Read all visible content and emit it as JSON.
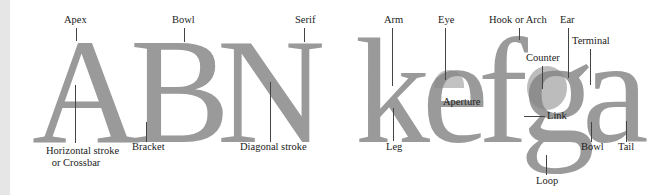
{
  "diagram": {
    "glyph_color": "#9a9a9a",
    "highlight_color": "#858585",
    "line_color": "#444444",
    "uppercase": [
      {
        "char": "A"
      },
      {
        "char": "B"
      },
      {
        "char": "N"
      }
    ],
    "lowercase": [
      {
        "char": "k"
      },
      {
        "char": "e"
      },
      {
        "char": "f"
      },
      {
        "char": "g"
      },
      {
        "char": "a"
      }
    ],
    "labels": {
      "apex": "Apex",
      "bowl_b": "Bowl",
      "serif": "Serif",
      "crossbar_line1": "Horizontal stroke",
      "crossbar_line2": "or Crossbar",
      "bracket": "Bracket",
      "diagonal": "Diagonal stroke",
      "arm": "Arm",
      "leg": "Leg",
      "eye": "Eye",
      "aperture": "Aperture",
      "hook": "Hook or Arch",
      "ear": "Ear",
      "counter": "Counter",
      "terminal": "Terminal",
      "link": "Link",
      "loop": "Loop",
      "bowl_a": "Bowl",
      "tail": "Tail"
    }
  }
}
